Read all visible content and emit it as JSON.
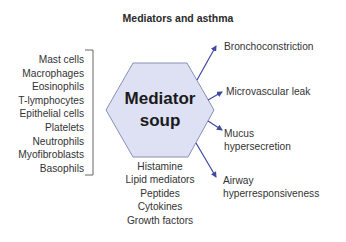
{
  "title": "Mediators and asthma",
  "center": {
    "line1": "Mediator",
    "line2": "soup",
    "fill_color": "#dde1f3",
    "stroke_color": "#8a8fb8"
  },
  "cell_sources": [
    "Mast cells",
    "Macrophages",
    "Eosinophils",
    "T-lymphocytes",
    "Epithelial cells",
    "Platelets",
    "Neutrophils",
    "Myofibroblasts",
    "Basophils"
  ],
  "mediator_types": [
    "Histamine",
    "Lipid mediators",
    "Peptides",
    "Cytokines",
    "Growth factors"
  ],
  "effects": [
    {
      "line1": "Bronchoconstriction",
      "line2": ""
    },
    {
      "line1": "Microvascular leak",
      "line2": ""
    },
    {
      "line1": "Mucus",
      "line2": "hypersecretion"
    },
    {
      "line1": "Airway",
      "line2": "hyperresponsiveness"
    }
  ],
  "colors": {
    "arrow": "#3d4aa0",
    "bracket": "#555555",
    "text": "#333333"
  }
}
